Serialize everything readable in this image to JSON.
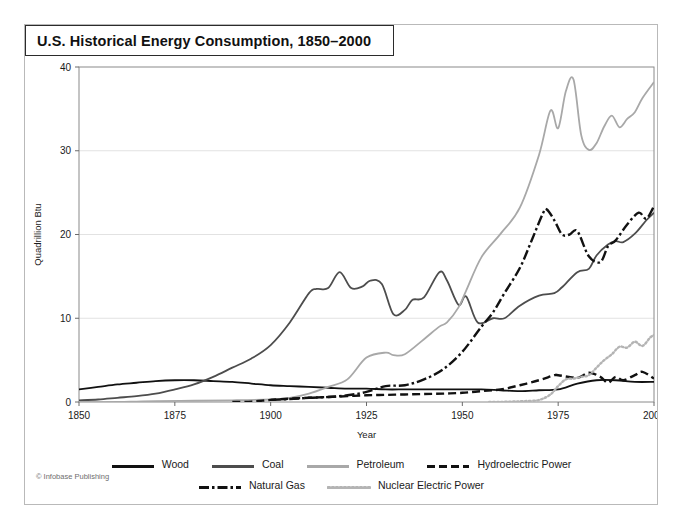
{
  "title": "U.S. Historical Energy Consumption, 1850–2000",
  "credit": "© Infobase Publishing",
  "legend": {
    "row1": [
      {
        "label": "Wood",
        "key": "wood"
      },
      {
        "label": "Coal",
        "key": "coal"
      },
      {
        "label": "Petroleum",
        "key": "petroleum"
      },
      {
        "label": "Hydroelectric Power",
        "key": "hydro"
      }
    ],
    "row2": [
      {
        "label": "Natural Gas",
        "key": "gas"
      },
      {
        "label": "Nuclear Electric Power",
        "key": "nuclear"
      }
    ]
  },
  "colors": {
    "wood": "#111111",
    "coal": "#4d4d4d",
    "petroleum": "#a8a8a8",
    "hydro": "#111111",
    "gas": "#111111",
    "nuclear": "#b4b4b4",
    "grid": "#e2e2e2",
    "frame": "#8a8a8a",
    "title_border": "#2b2b2b"
  },
  "chart_data": {
    "type": "line",
    "title": "U.S. Historical Energy Consumption, 1850–2000",
    "xlabel": "Year",
    "ylabel": "Quadrillion Btu",
    "xlim": [
      1850,
      2000
    ],
    "ylim": [
      0,
      40
    ],
    "xticks": [
      1850,
      1875,
      1900,
      1925,
      1950,
      1975,
      2000
    ],
    "yticks": [
      0,
      10,
      20,
      30,
      40
    ],
    "grid": "horizontal",
    "legend_position": "bottom",
    "series": [
      {
        "name": "Wood",
        "style": "solid",
        "color": "#111111",
        "x": [
          1850,
          1855,
          1860,
          1865,
          1870,
          1875,
          1880,
          1885,
          1890,
          1895,
          1900,
          1905,
          1910,
          1915,
          1920,
          1925,
          1930,
          1935,
          1940,
          1945,
          1950,
          1955,
          1960,
          1965,
          1970,
          1975,
          1980,
          1985,
          1990,
          1995,
          2000
        ],
        "y": [
          1.5,
          1.8,
          2.1,
          2.3,
          2.5,
          2.6,
          2.6,
          2.5,
          2.4,
          2.2,
          2.0,
          1.9,
          1.8,
          1.7,
          1.6,
          1.6,
          1.5,
          1.5,
          1.5,
          1.5,
          1.5,
          1.5,
          1.4,
          1.3,
          1.4,
          1.5,
          2.2,
          2.6,
          2.6,
          2.4,
          2.4
        ]
      },
      {
        "name": "Coal",
        "style": "solid",
        "color": "#4d4d4d",
        "x": [
          1850,
          1855,
          1860,
          1865,
          1870,
          1875,
          1880,
          1885,
          1890,
          1895,
          1900,
          1905,
          1910,
          1912,
          1915,
          1918,
          1921,
          1924,
          1926,
          1929,
          1932,
          1935,
          1937,
          1940,
          1944,
          1946,
          1949,
          1951,
          1954,
          1958,
          1961,
          1965,
          1970,
          1974,
          1976,
          1980,
          1983,
          1985,
          1988,
          1990,
          1992,
          1995,
          1998,
          2000
        ],
        "y": [
          0.2,
          0.3,
          0.5,
          0.7,
          1.0,
          1.5,
          2.1,
          3.0,
          4.1,
          5.2,
          6.8,
          9.5,
          13.0,
          13.5,
          13.6,
          15.5,
          13.6,
          13.8,
          14.5,
          14.1,
          10.5,
          11.0,
          12.2,
          12.5,
          15.5,
          14.5,
          11.6,
          12.6,
          9.5,
          10.0,
          10.0,
          11.5,
          12.7,
          13.0,
          13.7,
          15.5,
          15.9,
          17.5,
          18.8,
          19.2,
          19.1,
          20.1,
          21.7,
          22.6
        ]
      },
      {
        "name": "Petroleum",
        "style": "solid",
        "color": "#a8a8a8",
        "x": [
          1850,
          1860,
          1865,
          1870,
          1880,
          1890,
          1900,
          1905,
          1910,
          1915,
          1920,
          1925,
          1930,
          1932,
          1935,
          1940,
          1944,
          1946,
          1949,
          1951,
          1955,
          1960,
          1965,
          1970,
          1973,
          1975,
          1977,
          1979,
          1981,
          1983,
          1985,
          1987,
          1989,
          1991,
          1993,
          1995,
          1997,
          2000
        ],
        "y": [
          0,
          0,
          0.05,
          0.1,
          0.15,
          0.2,
          0.3,
          0.5,
          1.0,
          1.8,
          2.7,
          5.3,
          5.9,
          5.6,
          5.7,
          7.5,
          9.0,
          9.5,
          11.3,
          13.3,
          17.3,
          20.1,
          23.2,
          29.5,
          34.8,
          32.7,
          37.1,
          38.5,
          31.9,
          30.1,
          30.9,
          32.9,
          34.2,
          32.8,
          33.8,
          34.6,
          36.3,
          38.2
        ]
      },
      {
        "name": "Hydroelectric Power",
        "style": "dashed",
        "color": "#111111",
        "x": [
          1890,
          1895,
          1900,
          1905,
          1910,
          1915,
          1920,
          1925,
          1930,
          1935,
          1940,
          1945,
          1950,
          1955,
          1960,
          1965,
          1970,
          1974,
          1975,
          1980,
          1983,
          1986,
          1988,
          1990,
          1992,
          1995,
          1997,
          2000
        ],
        "y": [
          0.0,
          0.05,
          0.25,
          0.4,
          0.5,
          0.6,
          0.7,
          0.8,
          0.85,
          0.9,
          0.95,
          1.0,
          1.1,
          1.3,
          1.5,
          2.0,
          2.6,
          3.2,
          3.2,
          2.9,
          3.5,
          3.0,
          2.3,
          3.0,
          2.6,
          3.2,
          3.6,
          2.8
        ]
      },
      {
        "name": "Natural Gas",
        "style": "dashdot",
        "color": "#111111",
        "x": [
          1900,
          1905,
          1910,
          1915,
          1920,
          1925,
          1930,
          1935,
          1940,
          1945,
          1950,
          1955,
          1958,
          1961,
          1965,
          1968,
          1971,
          1972,
          1974,
          1976,
          1978,
          1980,
          1983,
          1986,
          1988,
          1990,
          1993,
          1996,
          1998,
          2000
        ],
        "y": [
          0.25,
          0.35,
          0.5,
          0.6,
          0.8,
          1.2,
          1.9,
          2.0,
          2.7,
          3.9,
          6.0,
          9.0,
          10.7,
          13.0,
          16.0,
          19.2,
          22.5,
          23.0,
          21.7,
          20.0,
          20.0,
          20.4,
          17.4,
          16.7,
          18.6,
          19.3,
          21.2,
          22.6,
          21.9,
          23.4
        ]
      },
      {
        "name": "Nuclear Electric Power",
        "style": "dotted",
        "color": "#b4b4b4",
        "x": [
          1957,
          1960,
          1963,
          1966,
          1970,
          1973,
          1975,
          1977,
          1979,
          1981,
          1983,
          1985,
          1987,
          1989,
          1991,
          1993,
          1995,
          1997,
          1999,
          2000
        ],
        "y": [
          0.0,
          0.01,
          0.05,
          0.1,
          0.24,
          0.9,
          1.9,
          2.7,
          2.8,
          3.0,
          3.2,
          4.1,
          5.0,
          5.7,
          6.6,
          6.5,
          7.2,
          6.7,
          7.7,
          8.0
        ]
      }
    ]
  }
}
